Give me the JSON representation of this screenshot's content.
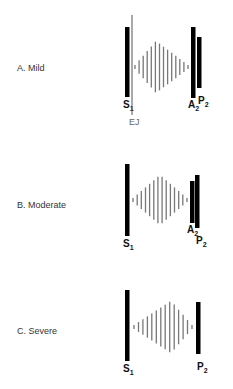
{
  "colors": {
    "sound": "#000000",
    "murmur": "#777777",
    "ej_line": "#555555",
    "ej_label": "#666666"
  },
  "panels": [
    {
      "label": "A. Mild",
      "label_y": 69,
      "s1": {
        "x": 125,
        "y1": 27,
        "y2": 97,
        "label": "S",
        "sub": "1"
      },
      "ej": {
        "x": 132,
        "y1": 15,
        "y2": 115,
        "label": "EJ"
      },
      "murmur": {
        "x_start": 135,
        "x_end": 188,
        "peak_x": 156,
        "center_y": 67,
        "max_half": 26,
        "count": 14
      },
      "a2": {
        "x": 191,
        "y1": 27,
        "y2": 98,
        "label": "A",
        "sub": "2"
      },
      "p2": {
        "x": 197,
        "y1": 37,
        "y2": 88,
        "label": "P",
        "sub": "2"
      }
    },
    {
      "label": "B. Moderate",
      "label_y": 207,
      "s1": {
        "x": 125,
        "y1": 164,
        "y2": 236,
        "label": "S",
        "sub": "1"
      },
      "murmur": {
        "x_start": 133,
        "x_end": 187,
        "peak_x": 160,
        "center_y": 200,
        "max_half": 25,
        "count": 14
      },
      "a2": {
        "x": 190,
        "y1": 181,
        "y2": 223,
        "label": "A",
        "sub": "2"
      },
      "p2": {
        "x": 195,
        "y1": 175,
        "y2": 228,
        "label": "P",
        "sub": "2"
      }
    },
    {
      "label": "C. Severe",
      "label_y": 332,
      "s1": {
        "x": 125,
        "y1": 290,
        "y2": 361,
        "label": "S",
        "sub": "1"
      },
      "murmur": {
        "x_start": 134,
        "x_end": 192,
        "peak_x": 171,
        "center_y": 327,
        "max_half": 26,
        "count": 14
      },
      "p2": {
        "x": 196,
        "y1": 302,
        "y2": 354,
        "label": "P",
        "sub": "2"
      }
    }
  ]
}
